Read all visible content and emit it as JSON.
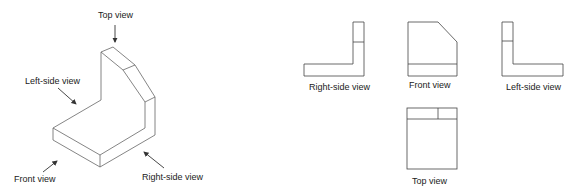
{
  "colors": {
    "line": "#555555",
    "text": "#222222",
    "background": "#ffffff"
  },
  "isometric": {
    "labels": {
      "top": "Top view",
      "left": "Left-side view",
      "front": "Front view",
      "right": "Right-side view"
    }
  },
  "orthographic": {
    "right_side": {
      "label": "Right-side view"
    },
    "front": {
      "label": "Front view"
    },
    "left_side": {
      "label": "Left-side view"
    },
    "top": {
      "label": "Top view"
    }
  }
}
